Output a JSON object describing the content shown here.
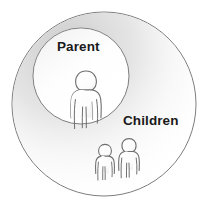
{
  "diagram": {
    "type": "venn-containment",
    "background_color": "#ffffff",
    "stroke_color": "#7a7a7a",
    "text_color": "#1a1a1a",
    "shading_color": "#d9d9d9",
    "outer_set": {
      "name": "children-set",
      "label": "Children",
      "center_x": 104,
      "center_y": 104,
      "radius": 92,
      "fill": "#ffffff"
    },
    "inner_set": {
      "name": "parent-set",
      "label": "Parent",
      "center_x": 81,
      "center_y": 76,
      "radius": 48,
      "fill": "#ffffff"
    },
    "figures": [
      {
        "name": "parent-figure",
        "role": "parent",
        "center_x": 86,
        "center_y": 96,
        "scale": 1.0
      },
      {
        "name": "child-figure-left",
        "role": "child",
        "center_x": 105,
        "center_y": 163,
        "scale": 0.62
      },
      {
        "name": "child-figure-right",
        "role": "child",
        "center_x": 129,
        "center_y": 159,
        "scale": 0.68
      }
    ]
  },
  "labels": {
    "parent": "Parent",
    "children": "Children"
  }
}
